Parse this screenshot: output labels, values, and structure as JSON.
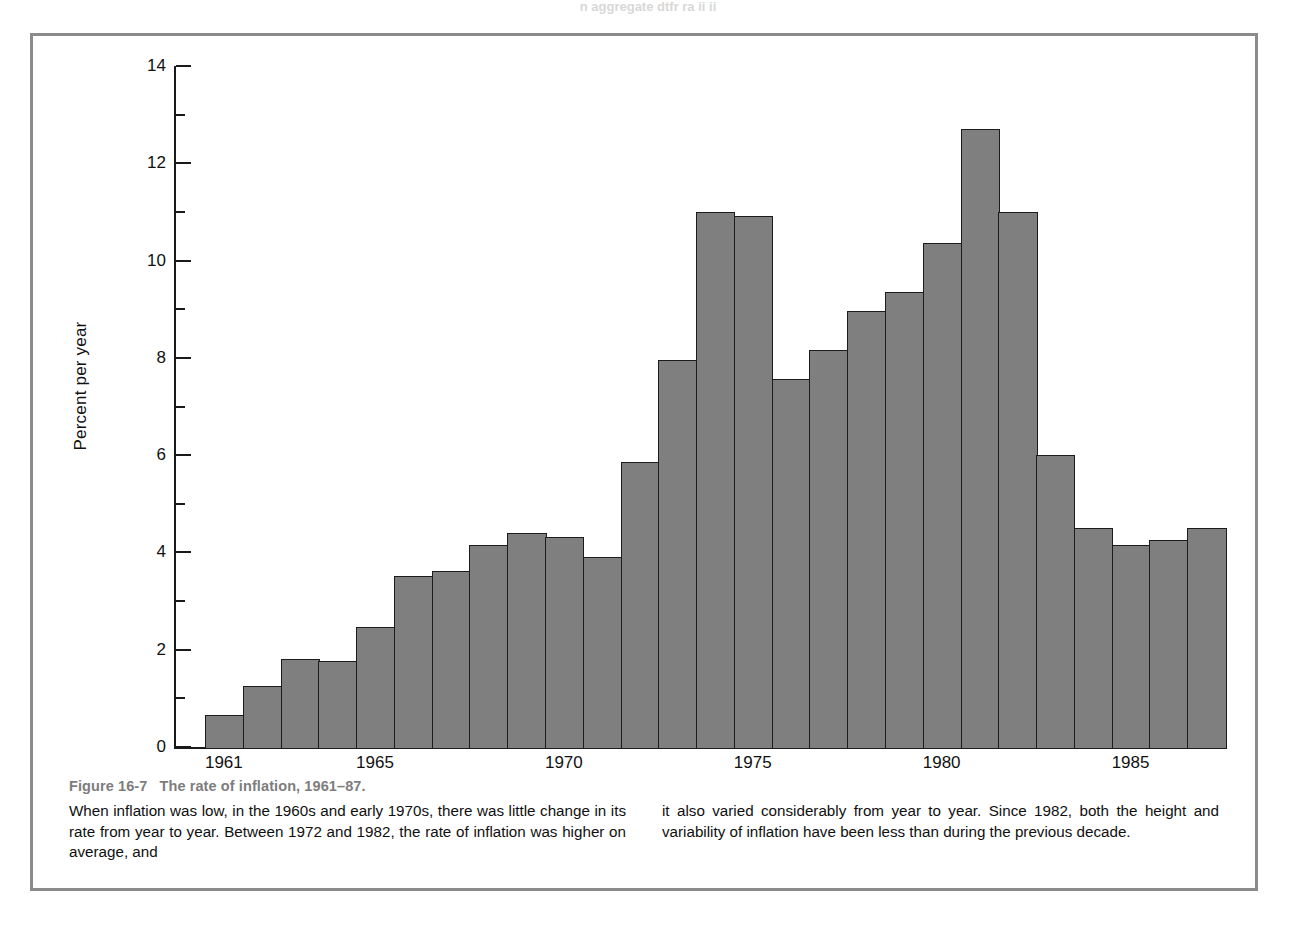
{
  "scan_bleed_text": "n aggregate dtfr ra  ii ii",
  "figure": {
    "number": "Figure 16-7",
    "title": "The rate of inflation, 1961–87.",
    "caption_left": "When inflation was low, in the 1960s and early 1970s, there was little change in its rate from year to year. Between 1972 and 1982, the rate of inflation was higher on average, and",
    "caption_right": "it also varied considerably from year to year. Since 1982, both the height and variability of inflation have been less than during the previous decade."
  },
  "colors": {
    "bar_fill": "#7f7f7f",
    "bar_stroke": "#1c1c1c",
    "frame": "#8b8b8b",
    "caption_title": "#7d7d7d",
    "text": "#101010"
  },
  "chart_data": {
    "type": "bar",
    "xlabel": "",
    "ylabel": "Percent per year",
    "ylim": [
      0,
      14
    ],
    "ytick_major": [
      0,
      2,
      4,
      6,
      8,
      10,
      12,
      14
    ],
    "ytick_minor": [
      1,
      3,
      5,
      7,
      9,
      11,
      13
    ],
    "ytick_labels": [
      "0",
      "2",
      "4",
      "6",
      "8",
      "10",
      "12",
      "14"
    ],
    "xtick_labels": [
      "1961",
      "1965",
      "1970",
      "1975",
      "1980",
      "1985"
    ],
    "xtick_years": [
      1961,
      1965,
      1970,
      1975,
      1980,
      1985
    ],
    "grid": false,
    "legend": null,
    "categories": [
      1961,
      1962,
      1963,
      1964,
      1965,
      1966,
      1967,
      1968,
      1969,
      1970,
      1971,
      1972,
      1973,
      1974,
      1975,
      1976,
      1977,
      1978,
      1979,
      1980,
      1981,
      1982,
      1983,
      1984,
      1985,
      1986,
      1987
    ],
    "values": [
      0.7,
      1.3,
      1.85,
      1.8,
      2.5,
      3.55,
      3.65,
      4.2,
      4.45,
      4.35,
      3.95,
      5.9,
      8.0,
      11.05,
      10.95,
      7.6,
      8.2,
      9.0,
      9.4,
      10.4,
      12.75,
      11.05,
      6.05,
      4.55,
      4.2,
      4.3,
      4.55
    ]
  }
}
